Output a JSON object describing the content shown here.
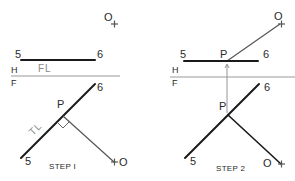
{
  "diagram": {
    "colors": {
      "line_strong": "#1a1a1a",
      "line_thin": "#555555",
      "fold_line": "#9a9a9a",
      "label_text": "#2a2a2a",
      "label_gray": "#8a8a8a",
      "background": "#ffffff"
    },
    "step1": {
      "caption": "STEP I",
      "fold_labels": {
        "upper": "H",
        "lower": "F"
      },
      "top_view": {
        "end_a": "5",
        "end_b": "6",
        "annotation": "FL",
        "point": "O",
        "point_mark": "+"
      },
      "front_view": {
        "end_a": "5",
        "end_b": "6",
        "intersection": "P",
        "annotation": "TL",
        "point": "O",
        "point_mark": "+"
      }
    },
    "step2": {
      "caption": "STEP 2",
      "fold_labels": {
        "upper": "H",
        "lower": "F"
      },
      "top_view": {
        "end_a": "5",
        "end_b": "6",
        "intersection": "P",
        "point": "O",
        "point_mark": "+"
      },
      "front_view": {
        "end_a": "5",
        "end_b": "6",
        "intersection": "P",
        "point": "O",
        "point_mark": "+"
      }
    }
  }
}
